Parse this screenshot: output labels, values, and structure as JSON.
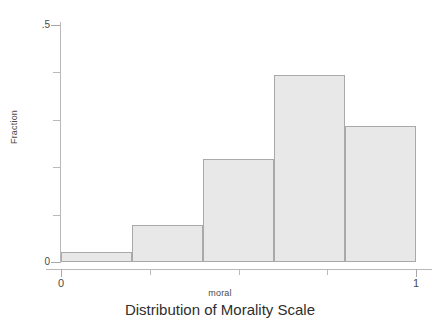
{
  "chart_data": {
    "type": "bar",
    "title": "Distribution of Morality Scale",
    "xlabel": "moral",
    "ylabel": "Fraction",
    "xlim": [
      0,
      1
    ],
    "ylim": [
      0,
      0.5
    ],
    "grid": false,
    "legend": null,
    "bin_edges": [
      0.0,
      0.2,
      0.4,
      0.6,
      0.8,
      1.0
    ],
    "categories": [
      "0.0-0.2",
      "0.2-0.4",
      "0.4-0.6",
      "0.6-0.8",
      "0.8-1.0"
    ],
    "values": [
      0.021,
      0.078,
      0.217,
      0.394,
      0.287
    ],
    "x_ticks": [
      {
        "value": 0,
        "label": "0",
        "major": true
      },
      {
        "value": 0.25,
        "label": "",
        "major": false
      },
      {
        "value": 0.5,
        "label": "",
        "major": false
      },
      {
        "value": 0.75,
        "label": "",
        "major": false
      },
      {
        "value": 1,
        "label": "1",
        "major": true
      }
    ],
    "y_ticks": [
      {
        "value": 0.5,
        "label": ".5",
        "major": true
      },
      {
        "value": 0.4,
        "label": "",
        "major": false
      },
      {
        "value": 0.3,
        "label": "",
        "major": false
      },
      {
        "value": 0.2,
        "label": "",
        "major": false
      },
      {
        "value": 0.1,
        "label": "",
        "major": false
      },
      {
        "value": 0,
        "label": "0",
        "major": true
      }
    ],
    "colors": {
      "bar_fill": "#e8e8e8",
      "bar_border": "#a9a9a9",
      "axis": "#b9b9b9",
      "text": "#4a4a4a",
      "title_text": "#2e2e2e",
      "background": "#ffffff"
    }
  }
}
